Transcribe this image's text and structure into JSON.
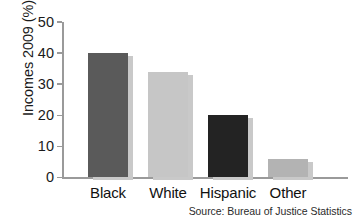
{
  "chart_data": {
    "type": "bar",
    "title": "",
    "categories": [
      "Black",
      "White",
      "Hispanic",
      "Other"
    ],
    "values": [
      40,
      34,
      20,
      6
    ],
    "series": [
      {
        "name": "Incomes 2009 (%)",
        "values": [
          40,
          34,
          20,
          6
        ]
      }
    ],
    "xlabel": "",
    "ylabel": "Incomes 2009 (%)",
    "ylim": [
      0,
      50
    ],
    "yticks": [
      0,
      10,
      20,
      30,
      40,
      50
    ],
    "ytick_labels": [
      "0",
      "10",
      "20",
      "30",
      "40",
      "50"
    ],
    "grid": false,
    "legend": false,
    "legend_position": "none",
    "annotations": [
      "Source: Bureau of Justice Statistics"
    ],
    "bar_colors": [
      "#5a5a5a",
      "#c6c6c6",
      "#232323",
      "#b3b3b3"
    ],
    "bar_shadow_color": "#c9c9c9",
    "axis_color": "#9a9a9a",
    "text_color": "#1a1a1a",
    "background": "#ffffff"
  },
  "axis": {
    "y_title": "Incomes 2009 (%)",
    "ticks": [
      {
        "value": 50,
        "label": "50"
      },
      {
        "value": 40,
        "label": "40"
      },
      {
        "value": 30,
        "label": "30"
      },
      {
        "value": 20,
        "label": "20"
      },
      {
        "value": 10,
        "label": "10"
      },
      {
        "value": 0,
        "label": "0"
      }
    ]
  },
  "bars": [
    {
      "label": "Black",
      "value": 40,
      "color": "#5a5a5a",
      "texture": "stripes-dark"
    },
    {
      "label": "White",
      "value": 34,
      "color": "#c6c6c6",
      "texture": "stripes-light"
    },
    {
      "label": "Hispanic",
      "value": 20,
      "color": "#232323",
      "texture": "stripes-black"
    },
    {
      "label": "Other",
      "value": 6,
      "color": "#b3b3b3",
      "texture": "stripes-plain"
    }
  ],
  "footer": {
    "source": "Source: Bureau of Justice Statistics"
  }
}
